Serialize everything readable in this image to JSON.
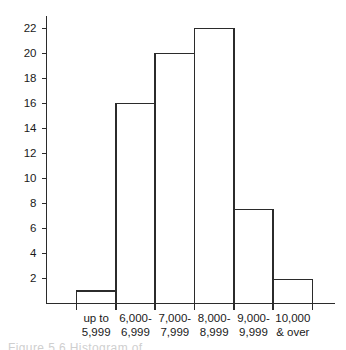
{
  "chart_data": {
    "type": "bar",
    "title": "",
    "subtitle": "",
    "xlabel": "",
    "ylabel": "",
    "categories": [
      "up to\n5,999",
      "6,000-\n6,999",
      "7,000-\n7,999",
      "8,000-\n8,999",
      "9,000-\n9,999",
      "10,000\n& over"
    ],
    "category_lines": [
      [
        "up to",
        "5,999"
      ],
      [
        "6,000-",
        "6,999"
      ],
      [
        "7,000-",
        "7,999"
      ],
      [
        "8,000-",
        "8,999"
      ],
      [
        "9,000-",
        "9,999"
      ],
      [
        "10,000",
        "& over"
      ]
    ],
    "values": [
      1,
      16,
      20,
      22,
      7.5,
      1.9
    ],
    "ylim": [
      0,
      23
    ],
    "yticks": [
      2,
      4,
      6,
      8,
      10,
      12,
      14,
      16,
      18,
      20,
      22
    ],
    "ytick_labels": [
      "2",
      "4",
      "6",
      "8",
      "10",
      "12",
      "14",
      "16",
      "18",
      "20",
      "22"
    ],
    "grid": false,
    "legend": null,
    "bar_fill": "#ffffff",
    "bar_stroke": "#2b2b2b",
    "axis_color": "#2b2b2b",
    "adjacent_bars": true
  },
  "caption": {
    "text": "Figure 5.6  Histogram of ..."
  }
}
